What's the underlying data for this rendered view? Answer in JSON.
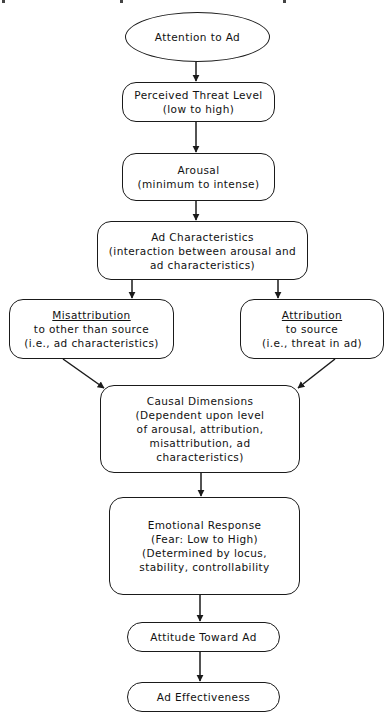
{
  "diagram": {
    "nodes": {
      "attention": {
        "lines": [
          "Attention to Ad"
        ]
      },
      "threat": {
        "lines": [
          "Perceived Threat Level",
          "(low to high)"
        ]
      },
      "arousal": {
        "lines": [
          "Arousal",
          "(minimum to intense)"
        ]
      },
      "adchar": {
        "lines": [
          "Ad Characteristics",
          "(interaction between arousal and",
          "ad characteristics)"
        ]
      },
      "misattribution": {
        "title": "Misattribution",
        "lines": [
          "to other than source",
          "(i.e., ad characteristics)"
        ]
      },
      "attribution": {
        "title": "Attribution",
        "lines": [
          "to source",
          "(i.e., threat in ad)"
        ]
      },
      "causal": {
        "lines": [
          "Causal Dimensions",
          "(Dependent upon level",
          "of arousal, attribution,",
          "misattribution, ad",
          "characteristics)"
        ]
      },
      "emotional": {
        "lines": [
          "Emotional Response",
          "(Fear: Low to High)",
          "(Determined by locus,",
          "stability, controllability"
        ]
      },
      "attitude": {
        "lines": [
          "Attitude Toward Ad"
        ]
      },
      "effectiveness": {
        "lines": [
          "Ad Effectiveness"
        ]
      }
    },
    "edges": [
      [
        "attention",
        "threat"
      ],
      [
        "threat",
        "arousal"
      ],
      [
        "arousal",
        "adchar"
      ],
      [
        "adchar",
        "misattribution"
      ],
      [
        "adchar",
        "attribution"
      ],
      [
        "misattribution",
        "causal"
      ],
      [
        "attribution",
        "causal"
      ],
      [
        "causal",
        "emotional"
      ],
      [
        "emotional",
        "attitude"
      ],
      [
        "attitude",
        "effectiveness"
      ]
    ],
    "colors": {
      "stroke": "#1a1a1a",
      "background": "#ffffff"
    }
  }
}
